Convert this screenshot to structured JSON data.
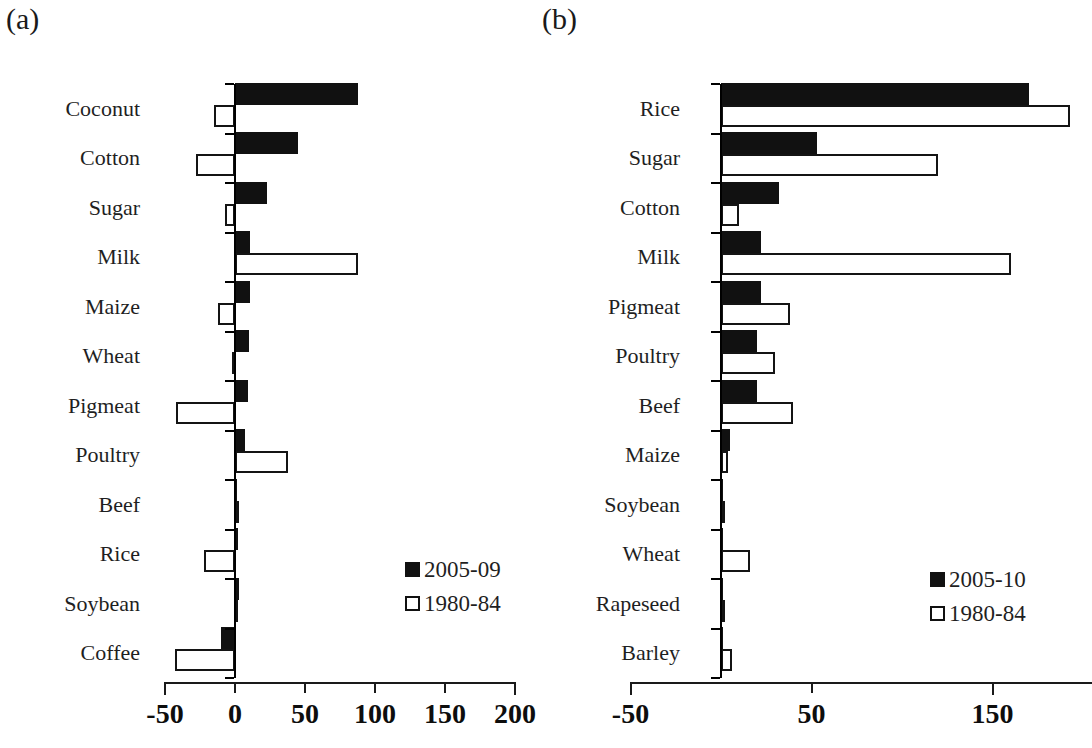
{
  "figure": {
    "panel_a_label": "(a)",
    "panel_b_label": "(b)"
  },
  "chart_data": [
    {
      "type": "bar",
      "orientation": "horizontal",
      "panel": "(a)",
      "title": "",
      "xlabel": "",
      "ylabel": "",
      "xlim": [
        -50,
        200
      ],
      "xticks": [
        -50,
        0,
        50,
        100,
        150,
        200
      ],
      "xticklabels": [
        "-50",
        "0",
        "50",
        "100",
        "150",
        "200"
      ],
      "grid": false,
      "legend_position": "center-right",
      "categories": [
        "Coconut",
        "Cotton",
        "Sugar",
        "Milk",
        "Maize",
        "Wheat",
        "Pigmeat",
        "Poultry",
        "Beef",
        "Rice",
        "Soybean",
        "Coffee"
      ],
      "series": [
        {
          "name": "2005-09",
          "color": "#111111",
          "style": "filled",
          "values": [
            88,
            45,
            23,
            11,
            11,
            10,
            9,
            7,
            1,
            2,
            3,
            -10
          ]
        },
        {
          "name": "1980-84",
          "color": "#ffffff",
          "style": "open",
          "values": [
            -15,
            -28,
            -7,
            88,
            -12,
            -2,
            -42,
            38,
            0,
            -22,
            -1,
            -43
          ]
        }
      ]
    },
    {
      "type": "bar",
      "orientation": "horizontal",
      "panel": "(b)",
      "title": "",
      "xlabel": "",
      "ylabel": "",
      "xlim": [
        -50,
        200
      ],
      "xticks": [
        -50,
        50,
        150
      ],
      "xticklabels": [
        "-50",
        "50",
        "150"
      ],
      "grid": false,
      "legend_position": "center-right",
      "categories": [
        "Rice",
        "Sugar",
        "Cotton",
        "Milk",
        "Pigmeat",
        "Poultry",
        "Beef",
        "Maize",
        "Soybean",
        "Wheat",
        "Rapeseed",
        "Barley"
      ],
      "series": [
        {
          "name": "2005-10",
          "color": "#111111",
          "style": "filled",
          "values": [
            170,
            53,
            32,
            22,
            22,
            20,
            20,
            5,
            0,
            0,
            0,
            0
          ]
        },
        {
          "name": "1980-84",
          "color": "#ffffff",
          "style": "open",
          "values": [
            193,
            120,
            10,
            160,
            38,
            30,
            40,
            4,
            0,
            16,
            0,
            6
          ]
        }
      ]
    }
  ]
}
